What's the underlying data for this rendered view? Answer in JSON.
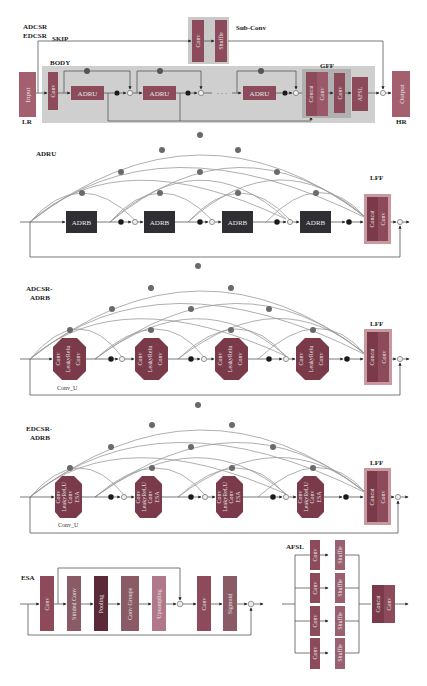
{
  "figure": {
    "top": {
      "labels": {
        "adcsr": "ADCSR",
        "edcsr": "EDCSR",
        "skip": "SKIP",
        "body": "BODY",
        "gff": "GFF",
        "lr": "LR",
        "hr": "HR",
        "sub_conv": "Sub-Conv"
      },
      "blocks": {
        "input": "Input",
        "conv": "Conv",
        "adru": "ADRU",
        "dots": "· · ·",
        "concat": "Concat",
        "conv2": "Conv",
        "conv3": "Conv",
        "afsl": "AFSL",
        "output": "Output",
        "sub_conv_conv": "Conv",
        "sub_conv_shuffle": "Shuffle"
      }
    },
    "adru": {
      "title": "ADRU",
      "block": "ADRB",
      "lff": "LFF",
      "concat": "Concat",
      "conv": "Conv"
    },
    "adcsr_adrb": {
      "title_line1": "ADCSR-",
      "title_line2": "ADRB",
      "block_lines": [
        "Conv",
        "LeakyRelu",
        "Conv"
      ],
      "caption": "Conv_U",
      "lff": "LFF",
      "concat": "Concat",
      "conv": "Conv"
    },
    "edcsr_adrb": {
      "title_line1": "EDCSR-",
      "title_line2": "ADRB",
      "block_lines": [
        "Conv",
        "LeakyReLU",
        "Conv",
        "ESA"
      ],
      "caption": "Conv_U",
      "lff": "LFF",
      "concat": "Concat",
      "conv": "Conv"
    },
    "esa": {
      "title": "ESA",
      "blocks": [
        "Conv",
        "Strided Conv",
        "Pooling",
        "Conv Groups",
        "Upsampling",
        "Conv",
        "Sigmoid"
      ]
    },
    "afsl": {
      "title": "AFSL",
      "conv": "Conv",
      "shuffle": "Shuffle",
      "concat": "Concat",
      "conv_out": "Conv"
    },
    "colors": {
      "body_bg": "#cfcfcf",
      "conv_block": "#8c4a5a",
      "adru_block": "#8c4a5a",
      "adrb_block": "#2f2f33",
      "octagon": "#7a3a4a",
      "input_output": "#a56070",
      "node_dark": "#1a1a1a",
      "node_gray": "#666666",
      "lff_bg": "#c89aa0",
      "gff_bg": "#b8b8b8"
    }
  }
}
